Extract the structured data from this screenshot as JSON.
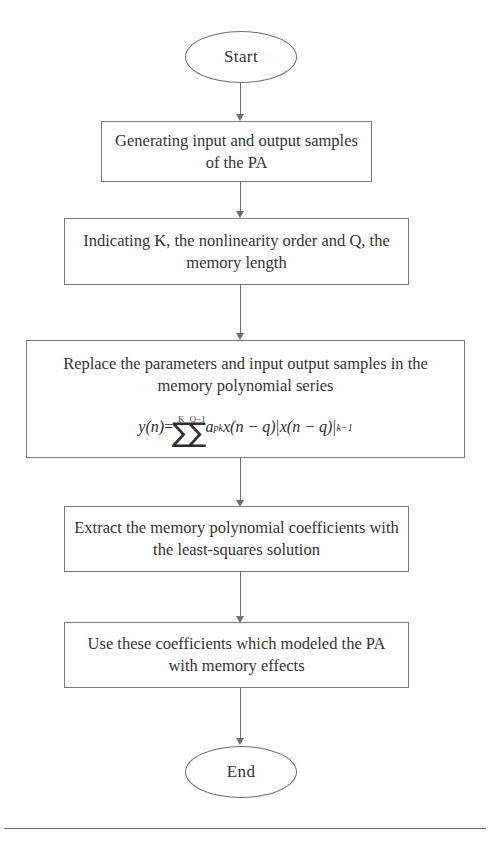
{
  "diagram": {
    "stroke_color": "#6e6e6e",
    "text_color": "#333333",
    "background_color": "#ffffff"
  },
  "nodes": {
    "start": {
      "label": "Start",
      "shape": "ellipse"
    },
    "step1": {
      "label": "Generating input and output samples of the PA",
      "shape": "process"
    },
    "step2": {
      "label": "Indicating K, the nonlinearity order and Q, the memory length",
      "shape": "process"
    },
    "step3": {
      "label": "Replace the parameters and input output samples in the memory polynomial series",
      "shape": "process"
    },
    "step4": {
      "label": "Extract the memory polynomial coefficients with the least-squares solution",
      "shape": "process"
    },
    "step5": {
      "label": "Use these coefficients which modeled the PA with memory effects",
      "shape": "process"
    },
    "end": {
      "label": "End",
      "shape": "ellipse"
    }
  },
  "equation": {
    "lhs": "y(n)",
    "equals": "=",
    "sum1_upper": "K",
    "sum1_symbol": "∑",
    "sum2_upper": "Q−1",
    "sum2_symbol": "∑",
    "coefficient": "a",
    "coefficient_subscript": "pk",
    "term1": "x(n − q)",
    "abs_open": "|",
    "term2": "x(n − q)",
    "abs_close": "|",
    "exponent": "k−1"
  },
  "connectors": [
    {
      "from": "start",
      "to": "step1",
      "arrow": "down"
    },
    {
      "from": "step1",
      "to": "step2",
      "arrow": "down"
    },
    {
      "from": "step2",
      "to": "step3",
      "arrow": "down"
    },
    {
      "from": "step3",
      "to": "step4",
      "arrow": "down"
    },
    {
      "from": "step4",
      "to": "step5",
      "arrow": "down"
    },
    {
      "from": "step5",
      "to": "end",
      "arrow": "down"
    }
  ]
}
